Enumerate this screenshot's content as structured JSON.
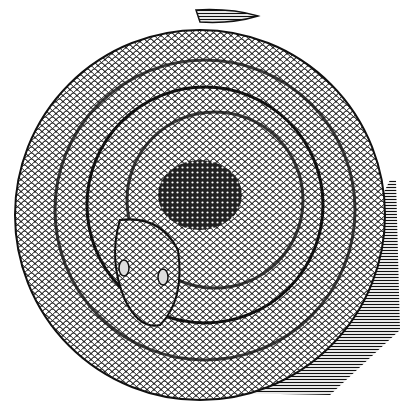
{
  "image": {
    "subject": "coiled rattlesnake engraving",
    "style": "black and white woodcut illustration",
    "colors": {
      "ink": "#111111",
      "paper": "#ffffff",
      "mid": "#6a6a6a"
    }
  }
}
